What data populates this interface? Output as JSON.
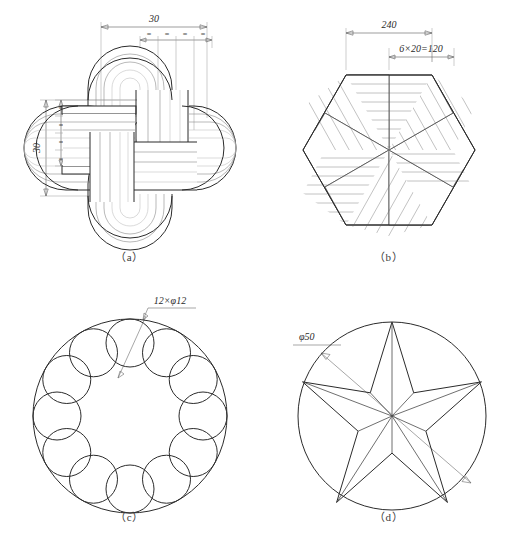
{
  "figure": {
    "background_color": "#ffffff",
    "line_color": "#2b2b2b",
    "panel_count": 4
  },
  "panels": [
    {
      "id": "a",
      "caption": "（a）",
      "subject": "celtic-knot",
      "description": "Four interlaced rounded-rectangular loops forming a pinwheel knot",
      "dimensions": [
        {
          "name": "overall-width",
          "label": "30",
          "orientation": "horizontal"
        },
        {
          "name": "overall-height",
          "label": "30",
          "orientation": "vertical"
        },
        {
          "name": "equal-spacing-top",
          "label": "=",
          "count": 4,
          "orientation": "horizontal"
        },
        {
          "name": "equal-spacing-left",
          "label": "=",
          "count": 4,
          "orientation": "vertical"
        }
      ]
    },
    {
      "id": "b",
      "caption": "（b）",
      "subject": "hatched-hexagon",
      "description": "Regular hexagon divided into six rhombi with alternating parallel hatching",
      "rhombus_count": 6,
      "hatch_lines_per_rhombus": 7,
      "dimensions": [
        {
          "name": "across-flats",
          "label": "240",
          "orientation": "horizontal"
        },
        {
          "name": "divided-span",
          "label": "6×20=120",
          "orientation": "horizontal"
        }
      ]
    },
    {
      "id": "c",
      "caption": "（c）",
      "subject": "circle-of-circles",
      "description": "Twelve equal tangent circles on a bolt-hole ring inscribed in a large circle",
      "hole_count": 12,
      "dimensions": [
        {
          "name": "hole-callout",
          "label": "12×φ12",
          "orientation": "leader"
        }
      ]
    },
    {
      "id": "d",
      "caption": "（d）",
      "subject": "five-pointed-star",
      "description": "Faceted five-pointed star inscribed in a circle, with rays from the centre",
      "points": 5,
      "dimensions": [
        {
          "name": "circle-diameter",
          "label": "φ50",
          "orientation": "diameter"
        }
      ]
    }
  ]
}
